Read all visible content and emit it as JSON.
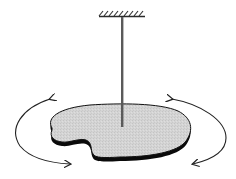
{
  "diagram": {
    "type": "torsion-pendulum",
    "components": {
      "ceiling_mount": {
        "label": "",
        "color": "#2a2a2a"
      },
      "torsion_wire": {
        "label": "",
        "color": "#5a5a5a"
      },
      "disc": {
        "label": "",
        "fill": "#d3d3d3",
        "edge": "#111111"
      },
      "rotation_arrows": [
        {
          "side": "left",
          "direction": "bidirectional"
        },
        {
          "side": "right",
          "direction": "bidirectional"
        }
      ]
    },
    "background": "#ffffff"
  }
}
